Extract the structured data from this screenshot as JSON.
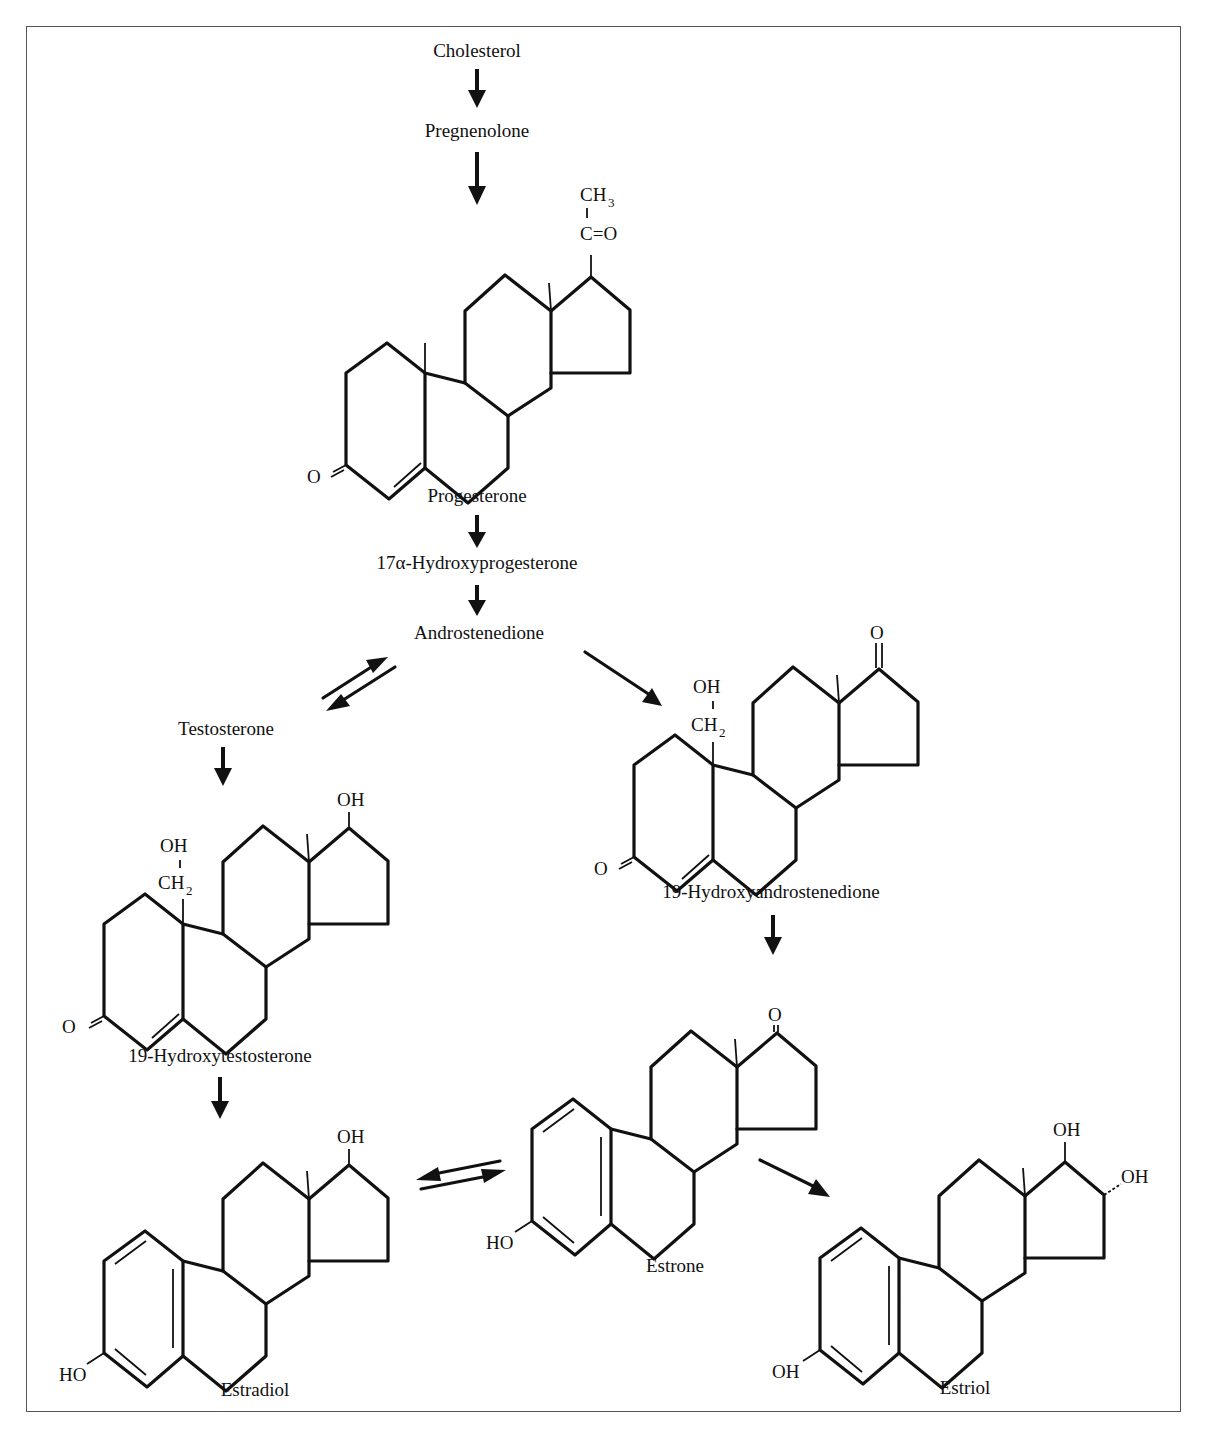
{
  "compounds": {
    "cholesterol": "Cholesterol",
    "pregnenolone": "Pregnenolone",
    "progesterone": "Progesterone",
    "hydroxyprogesterone": "17α-Hydroxyprogesterone",
    "androstenedione": "Androstenedione",
    "testosterone": "Testosterone",
    "hydroxyandrostenedione": "19-Hydroxyandrostenedione",
    "hydroxytestosterone": "19-Hydroxytestosterone",
    "estradiol": "Estradiol",
    "estrone": "Estrone",
    "estriol": "Estriol"
  },
  "atoms": {
    "ch3": "CH",
    "ch3_sub": "3",
    "c_eq_o": "C=O",
    "o": "O",
    "oh": "OH",
    "ho": "HO",
    "ch2": "CH",
    "ch2_sub": "2"
  },
  "pathway": [
    {
      "from": "Cholesterol",
      "to": "Pregnenolone",
      "type": "forward"
    },
    {
      "from": "Pregnenolone",
      "to": "Progesterone",
      "type": "forward"
    },
    {
      "from": "Progesterone",
      "to": "17α-Hydroxyprogesterone",
      "type": "forward"
    },
    {
      "from": "17α-Hydroxyprogesterone",
      "to": "Androstenedione",
      "type": "forward"
    },
    {
      "from": "Androstenedione",
      "to": "Testosterone",
      "type": "reversible"
    },
    {
      "from": "Androstenedione",
      "to": "19-Hydroxyandrostenedione",
      "type": "forward"
    },
    {
      "from": "Testosterone",
      "to": "19-Hydroxytestosterone",
      "type": "forward"
    },
    {
      "from": "19-Hydroxyandrostenedione",
      "to": "Estrone",
      "type": "forward"
    },
    {
      "from": "19-Hydroxytestosterone",
      "to": "Estradiol",
      "type": "forward"
    },
    {
      "from": "Estradiol",
      "to": "Estrone",
      "type": "reversible"
    },
    {
      "from": "Estrone",
      "to": "Estriol",
      "type": "forward"
    }
  ]
}
